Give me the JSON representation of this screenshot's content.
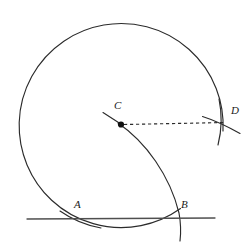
{
  "figure": {
    "background_color": "#ffffff",
    "stroke_color": "#2b2b2b",
    "line_color": "#555555",
    "label_color": "#1a1a1a",
    "width": 252,
    "height": 247
  },
  "labels": [
    {
      "name": "label-a",
      "text": "A",
      "x": 74,
      "y": 203
    },
    {
      "name": "label-b",
      "text": "B",
      "x": 181,
      "y": 203
    },
    {
      "name": "label-c",
      "text": "C",
      "x": 114,
      "y": 100
    },
    {
      "name": "label-d",
      "text": "D",
      "x": 231,
      "y": 105
    }
  ],
  "points": [
    {
      "name": "center-point-c",
      "x": 121,
      "y": 124,
      "radius": 3.1,
      "filled": true
    }
  ],
  "elements": {
    "main_circle": {
      "name": "main-circle-arc",
      "cx": 121,
      "cy": 122,
      "r": 102,
      "description": "large near-complete circle centered at C, open at lower-right"
    },
    "radius_segment": {
      "name": "radius-dashed-segment-cd",
      "x1": 123,
      "y1": 124,
      "x2": 226,
      "y2": 122,
      "dash": "3,3"
    },
    "tangent_line": {
      "name": "tangent-line-ab",
      "x1": 27,
      "y1": 219,
      "x2": 215,
      "y2": 218
    },
    "arc_cb": {
      "name": "arc-from-c-through-b",
      "description": "arc starting at C curving down-right through B and continuing below"
    },
    "arc_at_d": {
      "name": "intersecting-arc-at-d",
      "description": "shallow arc crossing the circle at D"
    },
    "tick_at_c": {
      "name": "tick-mark-at-c",
      "x1": 103,
      "y1": 113,
      "x2": 119,
      "y2": 123
    }
  }
}
